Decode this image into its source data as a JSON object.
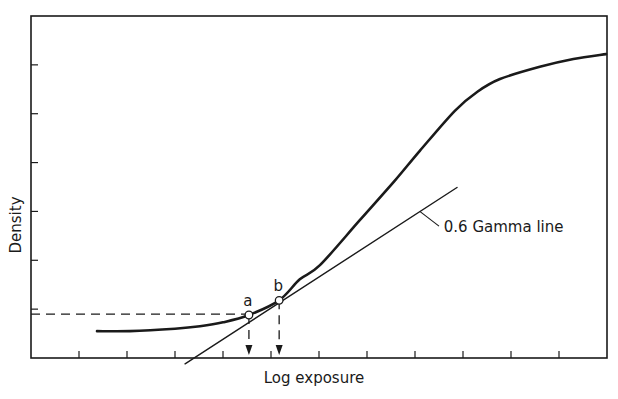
{
  "chart_data": {
    "type": "line",
    "title": "",
    "xlabel": "Log exposure",
    "ylabel": "Density",
    "xlim": [
      0,
      12
    ],
    "ylim": [
      0,
      7
    ],
    "grid": false,
    "x_ticks": [
      1,
      2,
      3,
      4,
      5,
      6,
      7,
      8,
      9,
      10,
      11
    ],
    "y_ticks": [
      1,
      2,
      3,
      4,
      5,
      6
    ],
    "x_tick_labels_shown": false,
    "y_tick_labels_shown": false,
    "series": [
      {
        "name": "Characteristic curve",
        "style": "thick",
        "points": [
          [
            1.375,
            0.55
          ],
          [
            2.06,
            0.55
          ],
          [
            3.0,
            0.6
          ],
          [
            3.52,
            0.65
          ],
          [
            4.0,
            0.73
          ],
          [
            4.54,
            0.88
          ],
          [
            5.17,
            1.18
          ],
          [
            5.6,
            1.61
          ],
          [
            6.02,
            1.9
          ],
          [
            6.85,
            2.82
          ],
          [
            7.58,
            3.63
          ],
          [
            8.1,
            4.24
          ],
          [
            8.83,
            5.06
          ],
          [
            9.3,
            5.45
          ],
          [
            9.77,
            5.71
          ],
          [
            10.6,
            5.96
          ],
          [
            11.3,
            6.12
          ],
          [
            11.98,
            6.22
          ]
        ]
      },
      {
        "name": "0.6 Gamma line",
        "style": "thin",
        "points": [
          [
            3.21,
            -0.12
          ],
          [
            8.875,
            3.49
          ]
        ]
      }
    ],
    "reference_lines": [
      {
        "name": "density-reference",
        "style": "dashed",
        "from": [
          0,
          0.9
        ],
        "to": [
          4.54,
          0.9
        ]
      },
      {
        "name": "drop-a",
        "style": "dashed-arrow",
        "from": [
          4.54,
          0.88
        ],
        "to": [
          4.54,
          0.06
        ]
      },
      {
        "name": "drop-b",
        "style": "dashed-arrow",
        "from": [
          5.17,
          1.18
        ],
        "to": [
          5.17,
          0.06
        ]
      }
    ],
    "marked_points": [
      {
        "label": "a",
        "x": 4.54,
        "y": 0.88
      },
      {
        "label": "b",
        "x": 5.17,
        "y": 1.18
      }
    ],
    "annotations": [
      {
        "text": "0.6 Gamma line",
        "target_series": "0.6 Gamma line",
        "leader_from": [
          8.1,
          3.0
        ],
        "leader_to": [
          8.5,
          2.7
        ],
        "text_at": [
          8.6,
          2.58
        ]
      }
    ]
  }
}
